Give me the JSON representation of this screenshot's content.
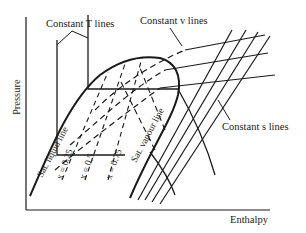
{
  "diagram": {
    "type": "pressure-enthalpy diagram",
    "axes": {
      "x_label": "Enthalpy",
      "y_label": "Pressure"
    },
    "labels": {
      "constant_t": "Constant T lines",
      "constant_v": "Constant v lines",
      "constant_s": "Constant s lines",
      "sat_liquid": "Sat. liquid line",
      "sat_vapour": "Sat. vapour line",
      "quality_lines": [
        "x = 0.25",
        "x = 0.5",
        "x = 0.75"
      ]
    },
    "colors": {
      "ink": "#1a1a1a",
      "background": "#ffffff"
    }
  }
}
